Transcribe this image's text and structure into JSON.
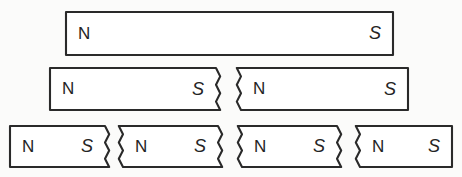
{
  "figure": {
    "background_color": "#fbfbfa",
    "line_color": "#2a2a2a",
    "fill_color": "#ffffff",
    "labels": {
      "north": "N",
      "south": "S"
    },
    "rows": [
      {
        "row_name": "whole-magnet",
        "piece_count": 1,
        "pieces": [
          {
            "name": "magnet-row1-piece1",
            "x": 66,
            "y": 12,
            "width": 327,
            "height": 43,
            "left_edge": "straight",
            "right_edge": "straight",
            "north": "N",
            "south": "S"
          }
        ]
      },
      {
        "row_name": "halves",
        "piece_count": 2,
        "pieces": [
          {
            "name": "magnet-row2-piece1",
            "x": 50,
            "y": 68,
            "width": 166,
            "height": 42,
            "left_edge": "straight",
            "right_edge": "jagged",
            "north": "N",
            "south": "S"
          },
          {
            "name": "magnet-row2-piece2",
            "x": 241,
            "y": 68,
            "width": 167,
            "height": 42,
            "left_edge": "jagged",
            "right_edge": "straight",
            "north": "N",
            "south": "S"
          }
        ]
      },
      {
        "row_name": "quarters",
        "piece_count": 4,
        "pieces": [
          {
            "name": "magnet-row3-piece1",
            "x": 10,
            "y": 126,
            "width": 95,
            "height": 41,
            "left_edge": "straight",
            "right_edge": "jagged",
            "north": "N",
            "south": "S"
          },
          {
            "name": "magnet-row3-piece2",
            "x": 123,
            "y": 126,
            "width": 95,
            "height": 41,
            "left_edge": "jagged",
            "right_edge": "jagged",
            "north": "N",
            "south": "S"
          },
          {
            "name": "magnet-row3-piece3",
            "x": 242,
            "y": 126,
            "width": 95,
            "height": 41,
            "left_edge": "jagged",
            "right_edge": "jagged",
            "north": "N",
            "south": "S"
          },
          {
            "name": "magnet-row3-piece4",
            "x": 360,
            "y": 126,
            "width": 92,
            "height": 41,
            "left_edge": "jagged",
            "right_edge": "straight",
            "north": "N",
            "south": "S"
          }
        ]
      }
    ]
  }
}
